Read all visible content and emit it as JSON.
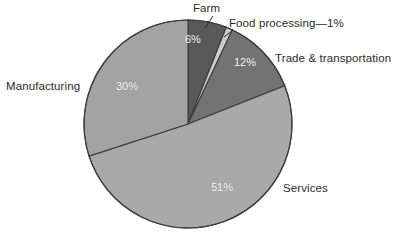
{
  "chart_data": {
    "type": "pie",
    "title": "",
    "subtitle": "",
    "xlabel": "",
    "ylabel": "",
    "legend_position": "none",
    "grid": false,
    "units": "percent",
    "total": 100,
    "start_angle_deg": 0,
    "direction": "clockwise",
    "categories": [
      "Farm",
      "Food processing",
      "Trade & transportation",
      "Services",
      "Manufacturing"
    ],
    "values": [
      6,
      1,
      12,
      51,
      30
    ],
    "slices": [
      {
        "name": "Farm",
        "label": "Farm",
        "value": 6,
        "pct_label": "6%",
        "color": "#595959",
        "start_deg": 0,
        "end_deg": 21.6,
        "label_placement": "outside-top",
        "has_leader_line": true
      },
      {
        "name": "Food processing",
        "label": "Food processing—1%",
        "value": 1,
        "pct_label": "1%",
        "color": "#cccccc",
        "start_deg": 21.6,
        "end_deg": 25.2,
        "label_placement": "outside-top-right",
        "has_leader_line": true
      },
      {
        "name": "Trade & transportation",
        "label": "Trade & transportation",
        "value": 12,
        "pct_label": "12%",
        "color": "#737373",
        "start_deg": 25.2,
        "end_deg": 68.4,
        "label_placement": "outside-right",
        "has_leader_line": false
      },
      {
        "name": "Services",
        "label": "Services",
        "value": 51,
        "pct_label": "51%",
        "color": "#a9a9a9",
        "start_deg": 68.4,
        "end_deg": 252.0,
        "label_placement": "outside-right-lower",
        "has_leader_line": false
      },
      {
        "name": "Manufacturing",
        "label": "Manufacturing",
        "value": 30,
        "pct_label": "30%",
        "color": "#a3a3a3",
        "start_deg": 252.0,
        "end_deg": 360.0,
        "label_placement": "outside-left",
        "has_leader_line": false
      }
    ]
  },
  "labels": {
    "farm": "Farm",
    "food_processing": "Food processing—1%",
    "trade_transportation": "Trade & transportation",
    "manufacturing": "Manufacturing",
    "services": "Services"
  },
  "percent_labels": {
    "farm": "6%",
    "trade_transportation": "12%",
    "manufacturing": "30%",
    "services": "51%"
  },
  "style": {
    "background": "#ffffff",
    "outline": "#3c3c3c",
    "slice_label_color": "#ffffff",
    "external_label_color": "#2b2b2b"
  }
}
